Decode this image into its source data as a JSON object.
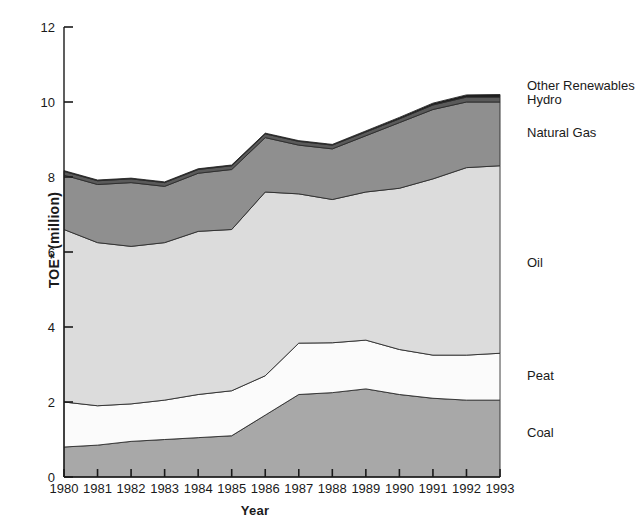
{
  "chart_data": {
    "type": "area",
    "stacked": true,
    "title": "",
    "xlabel": "Year",
    "ylabel": "TOE* (million)",
    "categories": [
      1980,
      1981,
      1982,
      1983,
      1984,
      1985,
      1986,
      1987,
      1988,
      1989,
      1990,
      1991,
      1992,
      1993
    ],
    "x": [
      "1980",
      "1981",
      "1982",
      "1983",
      "1984",
      "1985",
      "1986",
      "1987",
      "1988",
      "1989",
      "1990",
      "1991",
      "1992",
      "1993"
    ],
    "xlim": [
      1980,
      1993
    ],
    "ylim": [
      0,
      12
    ],
    "yticks": [
      0,
      2,
      4,
      6,
      8,
      10,
      12
    ],
    "ytick_labels": [
      "0",
      "2",
      "4",
      "6",
      "8",
      "10",
      "12"
    ],
    "xtick_labels": [
      "1980",
      "1981",
      "1982",
      "1983",
      "1984",
      "1985",
      "1986",
      "1987",
      "1988",
      "1989",
      "1990",
      "1991",
      "1992",
      "1993"
    ],
    "grid": false,
    "legend_position": "right-inline",
    "series": [
      {
        "name": "Coal",
        "color": "#a8a8a8",
        "values": [
          0.8,
          0.85,
          0.95,
          1.0,
          1.05,
          1.1,
          1.65,
          2.2,
          2.25,
          2.35,
          2.2,
          2.1,
          2.05,
          2.05
        ]
      },
      {
        "name": "Peat",
        "color": "#fbfbfb",
        "values": [
          1.2,
          1.05,
          1.0,
          1.05,
          1.15,
          1.2,
          1.05,
          1.37,
          1.33,
          1.3,
          1.2,
          1.15,
          1.2,
          1.25
        ]
      },
      {
        "name": "Oil",
        "color": "#dcdcdc",
        "values": [
          4.6,
          4.35,
          4.2,
          4.2,
          4.35,
          4.3,
          4.9,
          3.98,
          3.82,
          3.95,
          4.3,
          4.7,
          5.0,
          5.0
        ]
      },
      {
        "name": "Natural Gas",
        "color": "#8f8f8f",
        "values": [
          1.45,
          1.55,
          1.7,
          1.5,
          1.55,
          1.6,
          1.45,
          1.3,
          1.35,
          1.5,
          1.75,
          1.85,
          1.75,
          1.7
        ]
      },
      {
        "name": "Hydro",
        "color": "#5a5a5a",
        "values": [
          0.1,
          0.1,
          0.1,
          0.1,
          0.1,
          0.1,
          0.1,
          0.1,
          0.1,
          0.1,
          0.1,
          0.12,
          0.13,
          0.13
        ]
      },
      {
        "name": "Other Renewables",
        "color": "#1c1c1c",
        "values": [
          0.02,
          0.02,
          0.02,
          0.02,
          0.02,
          0.02,
          0.02,
          0.02,
          0.02,
          0.03,
          0.04,
          0.05,
          0.06,
          0.07
        ]
      }
    ],
    "totals": [
      8.17,
      7.92,
      7.97,
      7.87,
      8.22,
      8.32,
      9.17,
      8.97,
      8.87,
      9.23,
      9.59,
      9.97,
      10.19,
      10.2
    ],
    "footnote_marker": "*"
  },
  "axis": {
    "y_title": "TOE* (million)",
    "x_title": "Year"
  },
  "legend": {
    "items": [
      {
        "label": "Other Renewables",
        "key": "other-renewables"
      },
      {
        "label": "Hydro",
        "key": "hydro"
      },
      {
        "label": "Natural Gas",
        "key": "natural-gas"
      },
      {
        "label": "Oil",
        "key": "oil"
      },
      {
        "label": "Peat",
        "key": "peat"
      },
      {
        "label": "Coal",
        "key": "coal"
      }
    ]
  },
  "geometry": {
    "x0": 64,
    "x1": 500,
    "y0": 477,
    "y12": 27,
    "px_per_year": 33.54,
    "px_per_unit": 37.5
  }
}
